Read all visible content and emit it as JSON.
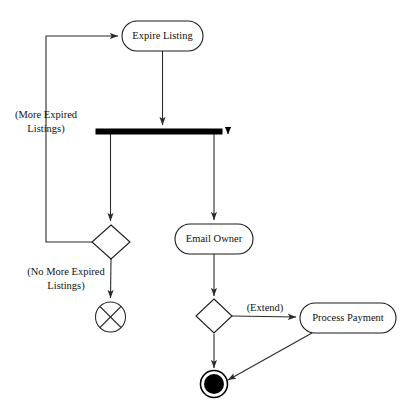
{
  "diagram": {
    "type": "uml-activity-diagram",
    "canvas": {
      "width": 414,
      "height": 419,
      "background": "#ffffff"
    },
    "stroke_color": "#2a2a2a",
    "fill_color": "#ffffff",
    "nodes": {
      "expire_listing": {
        "label": "Expire Listing",
        "kind": "action",
        "x": 122,
        "y": 21,
        "w": 81,
        "h": 30,
        "cx": 162.5,
        "cy": 36
      },
      "email_owner": {
        "label": "Email Owner",
        "kind": "action",
        "x": 175,
        "y": 224,
        "w": 78,
        "h": 30,
        "cx": 214,
        "cy": 239
      },
      "process_payment": {
        "label": "Process Payment",
        "kind": "action",
        "x": 300,
        "y": 303,
        "w": 96,
        "h": 30,
        "cx": 348,
        "cy": 318
      },
      "fork": {
        "label": "",
        "kind": "fork-bar",
        "x": 96,
        "y": 129,
        "w": 126,
        "h": 5,
        "cx": 159,
        "cy": 131.5
      },
      "decision_left": {
        "label": "",
        "kind": "decision",
        "cx": 111,
        "cy": 242,
        "rx": 19,
        "ry": 17
      },
      "decision_right": {
        "label": "",
        "kind": "decision",
        "cx": 214,
        "cy": 316,
        "rx": 18,
        "ry": 17
      },
      "flow_final": {
        "label": "",
        "kind": "flow-final",
        "cx": 110.5,
        "cy": 317,
        "r": 15
      },
      "activity_final": {
        "label": "",
        "kind": "activity-final",
        "cx": 214,
        "cy": 384,
        "r_outer": 13.5,
        "r_inner": 10
      }
    },
    "guards": [
      {
        "name": "more-expired-listings",
        "lines": [
          "(More Expired",
          "Listings)"
        ],
        "x": 46,
        "y": 118
      },
      {
        "name": "no-more-expired-listings",
        "lines": [
          "(No More Expired",
          "Listings)"
        ],
        "x": 66,
        "y": 275
      },
      {
        "name": "extend",
        "lines": [
          "(Extend)"
        ],
        "x": 265,
        "y": 311
      }
    ],
    "edges": [
      {
        "name": "loop-back-to-expire-listing",
        "d": "M 93 242 L 46 242 L 46 36 L 118 36",
        "arrow": "end"
      },
      {
        "name": "expire-listing-to-fork",
        "d": "M 162.5 51 L 162.5 125",
        "arrow": "end"
      },
      {
        "name": "fork-left-to-decision",
        "d": "M 110.5 134 L 110.5 221",
        "arrow": "end"
      },
      {
        "name": "fork-right-to-email-owner",
        "d": "M 214 134 L 214 220",
        "arrow": "end"
      },
      {
        "name": "fork-right-end-stub",
        "d": "M 228 127 L 228 134",
        "arrow": "end"
      },
      {
        "name": "decision-left-to-flow-final",
        "d": "M 111 259 L 110.5 298",
        "arrow": "end"
      },
      {
        "name": "email-owner-to-decision",
        "d": "M 214 254 L 214 296",
        "arrow": "end"
      },
      {
        "name": "decision-to-process-payment",
        "d": "M 232 316 L 296 317",
        "arrow": "end"
      },
      {
        "name": "decision-to-activity-final",
        "d": "M 214 334 L 214 368",
        "arrow": "end"
      },
      {
        "name": "process-payment-to-activity-final",
        "d": "M 312 333 L 228 380",
        "arrow": "end"
      }
    ]
  }
}
